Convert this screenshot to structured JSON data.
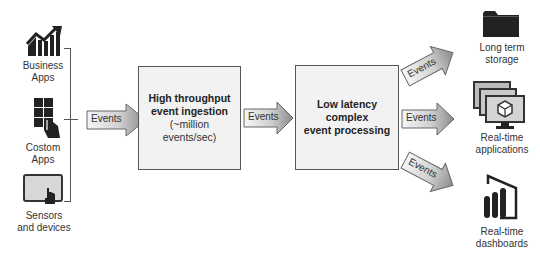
{
  "sources": [
    {
      "label_lines": [
        "Business",
        "Apps"
      ],
      "icon": "business-chart-icon"
    },
    {
      "label_lines": [
        "Costom",
        "Apps"
      ],
      "icon": "touch-app-icon"
    },
    {
      "label_lines": [
        "Sensors",
        "and devices"
      ],
      "icon": "tablet-touch-icon"
    }
  ],
  "arrows": {
    "ingest_in": "Events",
    "ingest_to_process": "Events",
    "out_storage": "Events",
    "out_applications": "Events",
    "out_dashboards": "Events"
  },
  "ingestion_box": {
    "title_lines": [
      "High throughput",
      "event ingestion"
    ],
    "subtitle_lines": [
      "(~million",
      "events/sec)"
    ]
  },
  "processing_box": {
    "title_lines": [
      "Low latency",
      "complex",
      "event processing"
    ]
  },
  "destinations": [
    {
      "label_lines": [
        "Long term",
        "storage"
      ],
      "icon": "folder-icon"
    },
    {
      "label_lines": [
        "Real-time",
        "applications"
      ],
      "icon": "monitors-cube-icon"
    },
    {
      "label_lines": [
        "Real-time",
        "dashboards"
      ],
      "icon": "power-bi-icon"
    }
  ],
  "colors": {
    "box_fill": "#f2f2f2",
    "box_border": "#555555",
    "arrow_gradient_start": "#f4f4f4",
    "arrow_gradient_end": "#8a8a8a",
    "icon_dark": "#222222"
  }
}
